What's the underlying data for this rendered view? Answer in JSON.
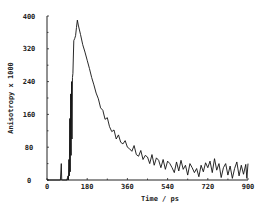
{
  "chart_data": {
    "type": "line",
    "title": "",
    "xlabel": "Time / ps",
    "ylabel": "Anisotropy x 1000",
    "xlim": [
      0,
      900
    ],
    "ylim": [
      0,
      400
    ],
    "xticks": [
      0,
      180,
      360,
      540,
      720,
      900
    ],
    "yticks": [
      0,
      80,
      160,
      240,
      320,
      400
    ],
    "xtick_labels": [
      "0",
      "180",
      "360",
      "540",
      "720",
      "900"
    ],
    "ytick_labels": [
      "0",
      "80",
      "160",
      "240",
      "320",
      "400"
    ],
    "grid": false,
    "legend": null,
    "series": [
      {
        "name": "anisotropy",
        "color": "#111111",
        "x": [
          0,
          60,
          64,
          66,
          68,
          70,
          72,
          90,
          94,
          96,
          98,
          100,
          102,
          104,
          106,
          108,
          110,
          112,
          114,
          116,
          118,
          120,
          124,
          128,
          132,
          136,
          140,
          150,
          160,
          170,
          180,
          190,
          200,
          210,
          220,
          230,
          240,
          250,
          260,
          270,
          280,
          290,
          300,
          310,
          320,
          330,
          340,
          350,
          360,
          370,
          380,
          390,
          400,
          410,
          420,
          430,
          440,
          450,
          460,
          470,
          480,
          490,
          500,
          510,
          520,
          530,
          540,
          550,
          560,
          570,
          580,
          590,
          600,
          610,
          620,
          630,
          640,
          650,
          660,
          670,
          680,
          690,
          700,
          710,
          720,
          730,
          740,
          750,
          760,
          770,
          780,
          790,
          800,
          810,
          820,
          830,
          840,
          850,
          860,
          870,
          880,
          890,
          895,
          900
        ],
        "y": [
          0,
          0,
          40,
          0,
          0,
          0,
          0,
          0,
          10,
          0,
          50,
          10,
          150,
          20,
          210,
          60,
          240,
          100,
          250,
          260,
          300,
          340,
          345,
          352,
          372,
          390,
          378,
          355,
          330,
          312,
          292,
          272,
          250,
          232,
          212,
          198,
          176,
          170,
          148,
          152,
          130,
          118,
          122,
          100,
          110,
          92,
          88,
          96,
          80,
          76,
          70,
          84,
          62,
          58,
          72,
          50,
          60,
          56,
          40,
          62,
          36,
          54,
          48,
          30,
          50,
          26,
          46,
          40,
          30,
          18,
          44,
          22,
          48,
          26,
          36,
          12,
          40,
          30,
          18,
          28,
          8,
          36,
          20,
          42,
          30,
          46,
          18,
          52,
          24,
          40,
          6,
          30,
          40,
          12,
          34,
          4,
          28,
          44,
          10,
          36,
          14,
          38,
          4,
          40
        ]
      }
    ]
  }
}
